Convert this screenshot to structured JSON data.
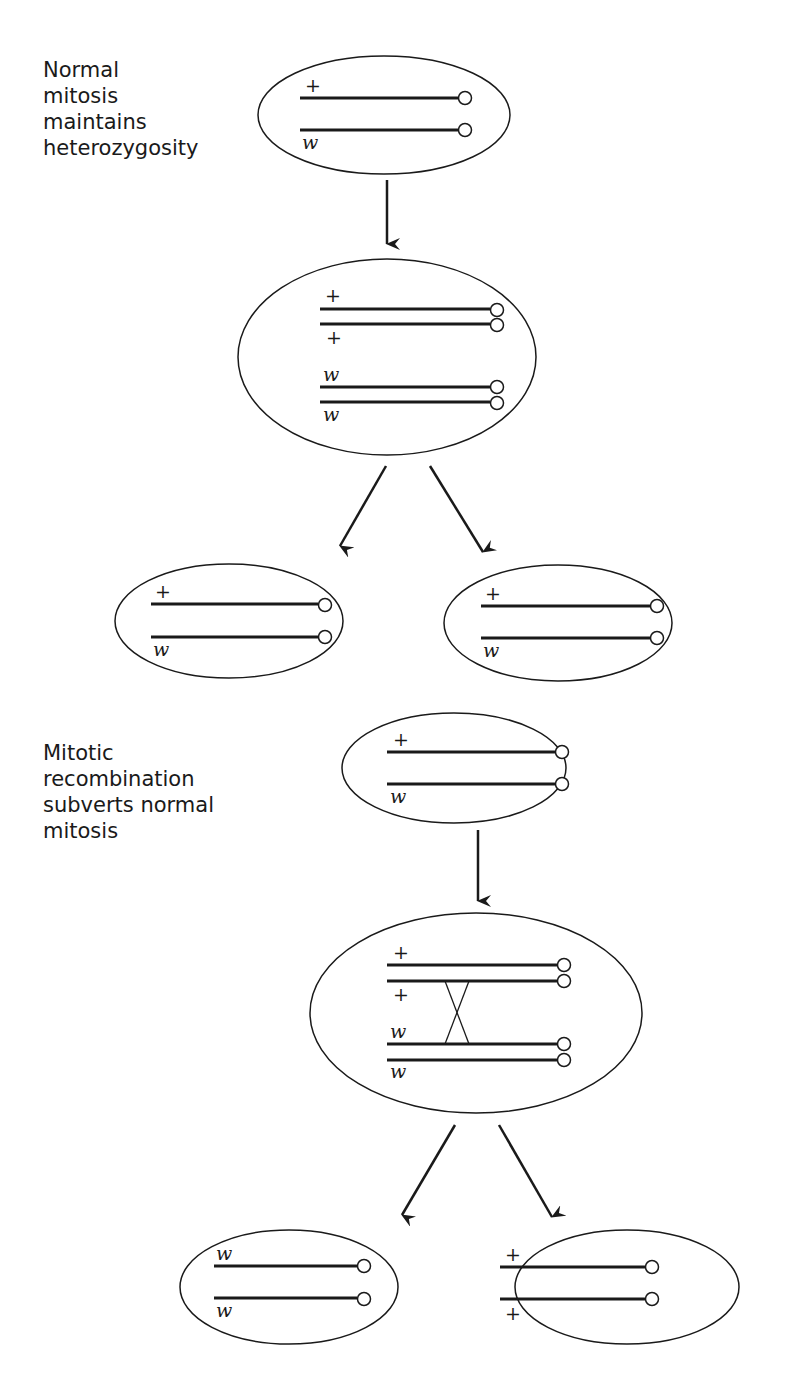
{
  "captions": {
    "normal": "Normal\nmitosis\nmaintains\nheterozygosity",
    "recombination": "Mitotic\nrecombination\nsubverts normal\nmitosis"
  },
  "alleles": {
    "plus": "+",
    "w": "w"
  },
  "cells": {
    "normal_parent": {
      "top": "+",
      "bottom": "w"
    },
    "normal_replicated": {
      "c1": "+",
      "c2": "+",
      "c3": "w",
      "c4": "w"
    },
    "normal_daughter_left": {
      "top": "+",
      "bottom": "w"
    },
    "normal_daughter_right": {
      "top": "+",
      "bottom": "w"
    },
    "recomb_parent": {
      "top": "+",
      "bottom": "w"
    },
    "recomb_replicated": {
      "c1": "+",
      "c2": "+",
      "c3": "w",
      "c4": "w"
    },
    "recomb_daughter_left": {
      "top": "w",
      "bottom": "w"
    },
    "recomb_daughter_right": {
      "top": "+",
      "bottom": "+"
    }
  },
  "colors": {
    "ink": "#1a1a1a",
    "background": "#ffffff"
  }
}
